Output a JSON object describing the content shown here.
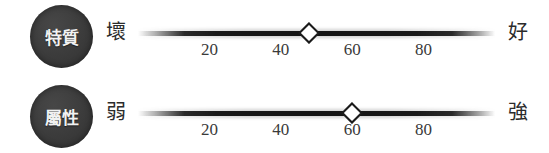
{
  "scale": {
    "background_color": "#ffffff",
    "badge_color": "#3b3b3b",
    "track_color": "#141414",
    "handle_fill": "#ffffff",
    "handle_stroke": "#1a1a1a",
    "axis": {
      "min": 0,
      "max": 100,
      "ticks": [
        20,
        40,
        60,
        80
      ]
    },
    "rows": [
      {
        "badge": "特質",
        "badge_icon": "trait-badge-icon",
        "left_anchor": "壞",
        "right_anchor": "好",
        "value": 48,
        "handle_icon": "diamond-slider-handle-icon",
        "ticks": [
          "20",
          "40",
          "60",
          "80"
        ]
      },
      {
        "badge": "屬性",
        "badge_icon": "attribute-badge-icon",
        "left_anchor": "弱",
        "right_anchor": "強",
        "value": 60,
        "handle_icon": "diamond-slider-handle-icon",
        "ticks": [
          "20",
          "40",
          "60",
          "80"
        ]
      }
    ]
  }
}
